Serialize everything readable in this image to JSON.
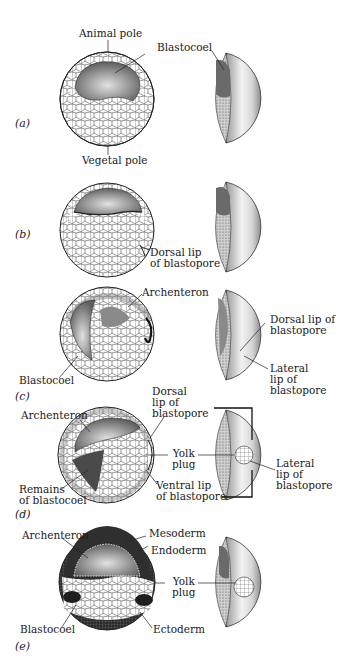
{
  "figure": {
    "panels": [
      {
        "id": "a",
        "letter": "(a)",
        "labels": {
          "animal_pole": "Animal pole",
          "blastocoel": "Blastocoel",
          "vegetal_pole": "Vegetal pole"
        }
      },
      {
        "id": "b",
        "letter": "(b)",
        "labels": {
          "dorsal_lip": "Dorsal lip\nof blastopore"
        }
      },
      {
        "id": "c",
        "letter": "(c)",
        "labels": {
          "archenteron": "Archenteron",
          "blastocoel": "Blastocoel",
          "dorsal_lip": "Dorsal lip of\nblastopore",
          "lateral_lip": "Lateral\nlip of\nblastopore"
        }
      },
      {
        "id": "d",
        "letter": "(d)",
        "labels": {
          "archenteron": "Archenteron",
          "dorsal_lip": "Dorsal\nlip of\nblastopore",
          "yolk_plug": "Yolk\nplug",
          "remains_blastocoel": "Remains\nof blastocoel",
          "ventral_lip": "Ventral lip\nof blastopore",
          "lateral_lip": "Lateral\nlip of\nblastopore"
        }
      },
      {
        "id": "e",
        "letter": "(e)",
        "labels": {
          "archenteron": "Archenteron",
          "mesoderm": "Mesoderm",
          "endoderm": "Endoderm",
          "yolk_plug": "Yolk\nplug",
          "blastocoel": "Blastocoel",
          "ectoderm": "Ectoderm"
        }
      }
    ]
  },
  "colors": {
    "line": "#222222",
    "cavity_dark": "#6e6e6e",
    "cavity_light": "#d9d9d9",
    "germ_dark": "#3a3a3a",
    "background": "#ffffff"
  }
}
